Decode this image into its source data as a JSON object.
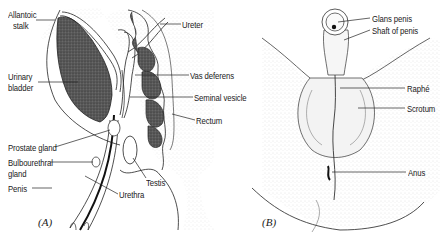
{
  "figure": {
    "panels": [
      {
        "id": "A",
        "panel_label": "(A)",
        "labels": [
          {
            "key": "allantoic_stalk_1",
            "text": "Allantoic"
          },
          {
            "key": "allantoic_stalk_2",
            "text": "stalk"
          },
          {
            "key": "urinary_bladder_1",
            "text": "Urinary"
          },
          {
            "key": "urinary_bladder_2",
            "text": "bladder"
          },
          {
            "key": "ureter",
            "text": "Ureter"
          },
          {
            "key": "vas_deferens",
            "text": "Vas deferens"
          },
          {
            "key": "seminal_vesicle",
            "text": "Seminal vesicle"
          },
          {
            "key": "rectum",
            "text": "Rectum"
          },
          {
            "key": "prostate_gland",
            "text": "Prostate gland"
          },
          {
            "key": "bulbourethral_gland_1",
            "text": "Bulbourethral"
          },
          {
            "key": "bulbourethral_gland_2",
            "text": "gland"
          },
          {
            "key": "penis",
            "text": "Penis"
          },
          {
            "key": "testis",
            "text": "Testis"
          },
          {
            "key": "urethra",
            "text": "Urethra"
          }
        ]
      },
      {
        "id": "B",
        "panel_label": "(B)",
        "labels": [
          {
            "key": "glans_penis",
            "text": "Glans penis"
          },
          {
            "key": "shaft_of_penis",
            "text": "Shaft of penis"
          },
          {
            "key": "raphe",
            "text": "Raphé"
          },
          {
            "key": "scrotum",
            "text": "Scrotum"
          },
          {
            "key": "anus",
            "text": "Anus"
          }
        ]
      }
    ]
  }
}
